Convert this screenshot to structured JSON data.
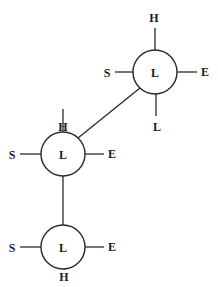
{
  "diagram": {
    "colors": {
      "stroke": "#2a2a2a",
      "text": "#1a1a1a",
      "background": "#ffffff"
    },
    "nodes": [
      {
        "id": "top-right",
        "label": "L",
        "cx": 155,
        "cy": 72,
        "r": 22,
        "spokes": [
          {
            "dir": "up",
            "label": "H"
          },
          {
            "dir": "left",
            "label": "S"
          },
          {
            "dir": "right",
            "label": "E"
          },
          {
            "dir": "down",
            "label": "L"
          }
        ]
      },
      {
        "id": "middle",
        "label": "L",
        "cx": 63,
        "cy": 154,
        "r": 22,
        "spokes": [
          {
            "dir": "up",
            "label": "H"
          },
          {
            "dir": "left",
            "label": "S"
          },
          {
            "dir": "right",
            "label": "E"
          }
        ]
      },
      {
        "id": "bottom",
        "label": "L",
        "cx": 63,
        "cy": 247,
        "r": 22,
        "spokes": [
          {
            "dir": "left",
            "label": "S"
          },
          {
            "dir": "right",
            "label": "E"
          },
          {
            "dir": "down",
            "label": "H"
          }
        ]
      }
    ],
    "edges": [
      {
        "from": "top-right",
        "to": "middle"
      },
      {
        "from": "middle",
        "to": "bottom"
      }
    ],
    "labels": {
      "n1_center": "L",
      "n1_up": "H",
      "n1_left": "S",
      "n1_right": "E",
      "n1_down": "L",
      "n2_center": "L",
      "n2_up": "H",
      "n2_left": "S",
      "n2_right": "E",
      "n3_center": "L",
      "n3_left": "S",
      "n3_right": "E",
      "n3_down": "H"
    }
  }
}
